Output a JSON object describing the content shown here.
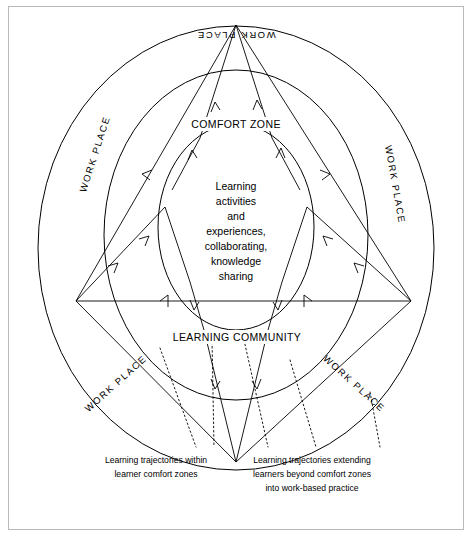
{
  "diagram": {
    "title_labels": {
      "comfort_zone": "COMFORT ZONE",
      "learning_community": "LEARNING COMMUNITY"
    },
    "workplace_labels": [
      "WORK PLACE",
      "WORK PLACE",
      "WORK PLACE",
      "WORK PLACE",
      "WORK PLACE"
    ],
    "center_text_lines": [
      "Learning",
      "activities",
      "and",
      "experiences,",
      "collaborating,",
      "knowledge",
      "sharing"
    ],
    "captions": {
      "left": [
        "Learning trajectories within",
        "learner comfort zones"
      ],
      "right": [
        "Learning trajectories extending",
        "learners beyond comfort zones",
        "into work-based practice"
      ]
    },
    "colors": {
      "stroke": "#000000",
      "background": "#ffffff",
      "frame": "#b9b9b9"
    }
  }
}
